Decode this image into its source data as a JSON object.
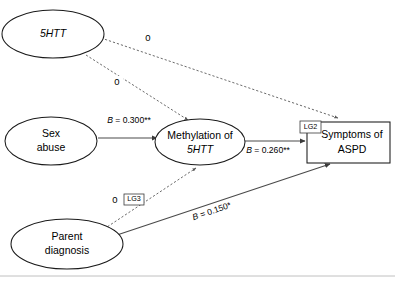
{
  "figure": {
    "type": "path-diagram",
    "background_color": "#ffffff",
    "line_color": "#4a4a4a",
    "text_color": "#000000"
  },
  "nodes": [
    {
      "id": "htt",
      "shape": "ellipse",
      "line1": "5HTT",
      "line2": "",
      "italic_line1": true,
      "italic_line2": false
    },
    {
      "id": "sex_abuse",
      "shape": "ellipse",
      "line1": "Sex",
      "line2": "abuse",
      "italic_line1": false,
      "italic_line2": false
    },
    {
      "id": "methylation",
      "shape": "ellipse",
      "line1": "Methylation of",
      "line2": "5HTT",
      "italic_line1": false,
      "italic_line2": true
    },
    {
      "id": "parent_diagnosis",
      "shape": "ellipse",
      "line1": "Parent",
      "line2": "diagnosis",
      "italic_line1": false,
      "italic_line2": false
    },
    {
      "id": "aspd",
      "shape": "rectangle",
      "line1": "Symptoms of",
      "line2": "ASPD",
      "italic_line1": false,
      "italic_line2": false
    }
  ],
  "edges": [
    {
      "id": "htt_to_aspd",
      "from": "htt",
      "to": "aspd",
      "style": "dashed",
      "label": "0",
      "label_kind": "zero"
    },
    {
      "id": "htt_to_methylation",
      "from": "htt",
      "to": "methylation",
      "style": "dashed",
      "label": "0",
      "label_kind": "zero"
    },
    {
      "id": "sexabuse_to_methylation",
      "from": "sex_abuse",
      "to": "methylation",
      "style": "solid",
      "label_b": "B",
      "label_eq": " = 0.300**",
      "label_kind": "coefficient"
    },
    {
      "id": "methylation_to_aspd",
      "from": "methylation",
      "to": "aspd",
      "style": "solid",
      "label_b": "B",
      "label_eq": " = 0.260**",
      "label_kind": "coefficient"
    },
    {
      "id": "parent_to_methylation",
      "from": "parent_diagnosis",
      "to": "methylation",
      "style": "dashed",
      "label": "0",
      "label_kind": "zero"
    },
    {
      "id": "parent_to_aspd",
      "from": "parent_diagnosis",
      "to": "aspd",
      "style": "solid",
      "label_b": "B",
      "label_eq": " = 0.150*",
      "label_kind": "coefficient"
    }
  ],
  "tags": [
    {
      "id": "lg2",
      "text": "LG2",
      "attached_to": "aspd"
    },
    {
      "id": "lg3",
      "text": "LG3",
      "attached_to": "parent_to_methylation"
    }
  ]
}
